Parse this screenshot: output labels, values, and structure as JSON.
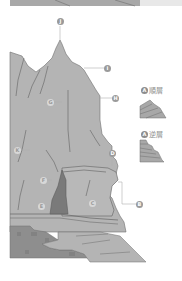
{
  "diagram": {
    "colors": {
      "rock_fill": "#b4b4b4",
      "rock_outline": "#6e6e6e",
      "cave_fill": "#7a7a7a",
      "ground_dark": "#8e8e8e",
      "marker": "#9a9a9a",
      "top_band": "#a8a8a8"
    },
    "callouts": [
      {
        "letter": "J",
        "target": "summit"
      },
      {
        "letter": "I",
        "target": "upper ridge slope"
      },
      {
        "letter": "H",
        "target": "cliff face"
      },
      {
        "letter": "G",
        "target": "central rock face"
      },
      {
        "letter": "K",
        "target": "left slope"
      },
      {
        "letter": "F",
        "target": "rock mass above cave"
      },
      {
        "letter": "E",
        "target": "cave interior"
      },
      {
        "letter": "C",
        "target": "overhang rock"
      },
      {
        "letter": "D",
        "target": "ledge"
      },
      {
        "letter": "B",
        "target": "undercut notch"
      }
    ],
    "insets": [
      {
        "badge": "A",
        "label": "順層"
      },
      {
        "badge": "A",
        "label": "逆層"
      }
    ]
  }
}
